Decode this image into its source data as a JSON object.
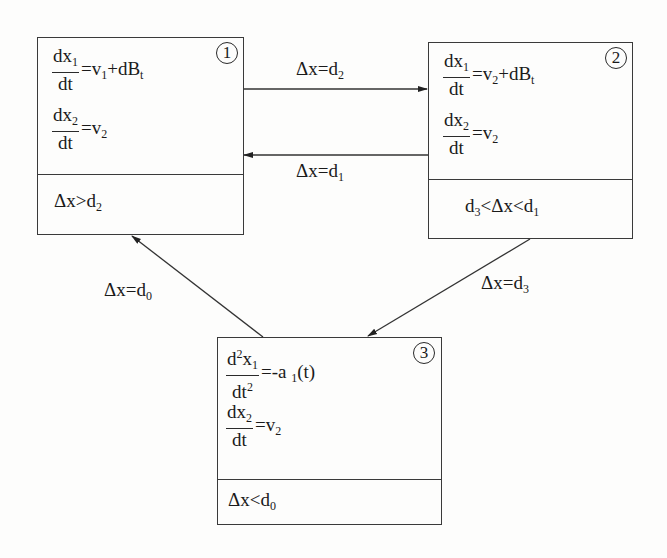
{
  "diagram": {
    "type": "state-transition",
    "states": [
      {
        "id": "1",
        "badge": "1",
        "eq1": {
          "num": "dx",
          "num_sub": "1",
          "den": "dt",
          "rhs": "=v",
          "rhs_sub": "1",
          "rhs_tail": "+dB",
          "rhs_tail_sub": "t"
        },
        "eq2": {
          "num": "dx",
          "num_sub": "2",
          "den": "dt",
          "rhs": "=v",
          "rhs_sub": "2"
        },
        "condition": {
          "text": "Δx>d",
          "sub": "2"
        }
      },
      {
        "id": "2",
        "badge": "2",
        "eq1": {
          "num": "dx",
          "num_sub": "1",
          "den": "dt",
          "rhs": "=v",
          "rhs_sub": "2",
          "rhs_tail": "+dB",
          "rhs_tail_sub": "t"
        },
        "eq2": {
          "num": "dx",
          "num_sub": "2",
          "den": "dt",
          "rhs": "=v",
          "rhs_sub": "2"
        },
        "condition": {
          "pre": "d",
          "pre_sub": "3",
          "text": "<Δx<d",
          "sub": "1"
        }
      },
      {
        "id": "3",
        "badge": "3",
        "eq1": {
          "num_pre": "d",
          "num_sup": "2",
          "num": "x",
          "num_sub": "1",
          "den": "dt",
          "den_sup": "2",
          "rhs": "=-a ",
          "rhs_sub": "1",
          "rhs_tail": "(t)"
        },
        "eq2": {
          "num": "dx",
          "num_sub": "2",
          "den": "dt",
          "rhs": "=v",
          "rhs_sub": "2"
        },
        "condition": {
          "text": "Δx<d",
          "sub": "0"
        }
      }
    ],
    "transitions": [
      {
        "from": "1",
        "to": "2",
        "label": "Δx=d",
        "label_sub": "2"
      },
      {
        "from": "2",
        "to": "1",
        "label": "Δx=d",
        "label_sub": "1"
      },
      {
        "from": "2",
        "to": "3",
        "label": "Δx=d",
        "label_sub": "3"
      },
      {
        "from": "3",
        "to": "1",
        "label": "Δx=d",
        "label_sub": "0"
      }
    ]
  }
}
